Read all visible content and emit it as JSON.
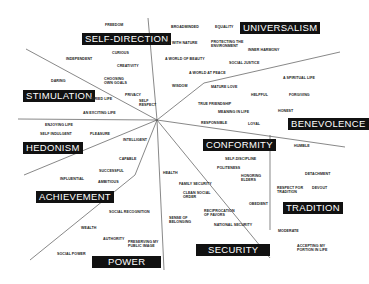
{
  "diagram": {
    "line_color": "#555555",
    "category_bg": "#111111",
    "category_fg": "#ffffff",
    "categories": [
      {
        "name": "self-direction",
        "label": "SELF-DIRECTION",
        "x": 82,
        "y": 33
      },
      {
        "name": "universalism",
        "label": "UNIVERSALISM",
        "x": 240,
        "y": 22
      },
      {
        "name": "stimulation",
        "label": "STIMULATION",
        "x": 23,
        "y": 90
      },
      {
        "name": "benevolence",
        "label": "BENEVOLENCE",
        "x": 288,
        "y": 118
      },
      {
        "name": "hedonism",
        "label": "HEDONISM",
        "x": 23,
        "y": 142
      },
      {
        "name": "conformity",
        "label": "CONFORMITY",
        "x": 203,
        "y": 139
      },
      {
        "name": "achievement",
        "label": "ACHIEVEMENT",
        "x": 36,
        "y": 191
      },
      {
        "name": "tradition",
        "label": "TRADITION",
        "x": 283,
        "y": 202
      },
      {
        "name": "security",
        "label": "SECURITY",
        "x": 196,
        "y": 244
      },
      {
        "name": "power",
        "label": "POWER",
        "x": 92,
        "y": 256
      }
    ],
    "values": [
      {
        "text": "FREEDOM",
        "x": 105,
        "y": 23
      },
      {
        "text": "CURIOUS",
        "x": 112,
        "y": 51
      },
      {
        "text": "INDEPENDENT",
        "x": 66,
        "y": 57
      },
      {
        "text": "CREATIVITY",
        "x": 117,
        "y": 64
      },
      {
        "text": "DARING",
        "x": 51,
        "y": 79
      },
      {
        "text": "CHOOSING\nOWN GOALS",
        "x": 104,
        "y": 77
      },
      {
        "text": "PRIVACY",
        "x": 125,
        "y": 93
      },
      {
        "text": "A VARIED LIFE",
        "x": 86,
        "y": 97
      },
      {
        "text": "SELF\nRESPECT",
        "x": 139,
        "y": 99
      },
      {
        "text": "AN EXCITING LIFE",
        "x": 83,
        "y": 111
      },
      {
        "text": "ENJOYING LIFE",
        "x": 45,
        "y": 123
      },
      {
        "text": "SELF INDULGENT",
        "x": 40,
        "y": 132
      },
      {
        "text": "PLEASURE",
        "x": 90,
        "y": 132
      },
      {
        "text": "INTELLIGENT",
        "x": 123,
        "y": 138
      },
      {
        "text": "CAPABLE",
        "x": 119,
        "y": 157
      },
      {
        "text": "SUCCESSFUL",
        "x": 99,
        "y": 169
      },
      {
        "text": "INFLUENTIAL",
        "x": 60,
        "y": 177
      },
      {
        "text": "AMBITIOUS",
        "x": 98,
        "y": 180
      },
      {
        "text": "SOCIAL RECOGNITION",
        "x": 109,
        "y": 210
      },
      {
        "text": "WEALTH",
        "x": 81,
        "y": 226
      },
      {
        "text": "AUTHORITY",
        "x": 103,
        "y": 237
      },
      {
        "text": "PRESERVING MY\nPUBLIC IMAGE",
        "x": 128,
        "y": 240
      },
      {
        "text": "SOCIAL POWER",
        "x": 57,
        "y": 252
      },
      {
        "text": "BROADMINDED",
        "x": 171,
        "y": 25
      },
      {
        "text": "EQUALITY",
        "x": 215,
        "y": 25
      },
      {
        "text": "UNITY WITH NATURE",
        "x": 160,
        "y": 41
      },
      {
        "text": "PROTECTING THE\nENVIRONMENT",
        "x": 211,
        "y": 40
      },
      {
        "text": "INNER HARMONY",
        "x": 248,
        "y": 48
      },
      {
        "text": "A WORLD OF BEAUTY",
        "x": 165,
        "y": 57
      },
      {
        "text": "SOCIAL JUSTICE",
        "x": 229,
        "y": 61
      },
      {
        "text": "A WORLD AT PEACE",
        "x": 189,
        "y": 71
      },
      {
        "text": "WISDOM",
        "x": 172,
        "y": 84
      },
      {
        "text": "A SPIRITUAL LIFE",
        "x": 283,
        "y": 76
      },
      {
        "text": "MATURE LOVE",
        "x": 211,
        "y": 85
      },
      {
        "text": "HELPFUL",
        "x": 251,
        "y": 93
      },
      {
        "text": "FORGIVING",
        "x": 289,
        "y": 93
      },
      {
        "text": "TRUE FRIENDSHIP",
        "x": 198,
        "y": 102
      },
      {
        "text": "HONEST",
        "x": 278,
        "y": 109
      },
      {
        "text": "MEANING IN LIFE",
        "x": 218,
        "y": 110
      },
      {
        "text": "RESPONSIBLE",
        "x": 201,
        "y": 121
      },
      {
        "text": "LOYAL",
        "x": 248,
        "y": 122
      },
      {
        "text": "HUMBLE",
        "x": 294,
        "y": 144
      },
      {
        "text": "SELF-DISCIPLINE",
        "x": 225,
        "y": 157
      },
      {
        "text": "POLITENESS",
        "x": 217,
        "y": 166
      },
      {
        "text": "HEALTH",
        "x": 163,
        "y": 171
      },
      {
        "text": "HONORING\nELDERS",
        "x": 241,
        "y": 174
      },
      {
        "text": "DETACHMENT",
        "x": 305,
        "y": 172
      },
      {
        "text": "FAMILY SECURITY",
        "x": 179,
        "y": 182
      },
      {
        "text": "RESPECT FOR\nTRADITION",
        "x": 277,
        "y": 186
      },
      {
        "text": "DEVOUT",
        "x": 312,
        "y": 186
      },
      {
        "text": "CLEAN SOCIAL\nORDER",
        "x": 183,
        "y": 191
      },
      {
        "text": "OBEDIENT",
        "x": 249,
        "y": 202
      },
      {
        "text": "RECIPROCATION\nOF FAVORS",
        "x": 204,
        "y": 209
      },
      {
        "text": "SENSE OF\nBELONGING",
        "x": 169,
        "y": 216
      },
      {
        "text": "NATIONAL SECURITY",
        "x": 214,
        "y": 223
      },
      {
        "text": "MODERATE",
        "x": 278,
        "y": 229
      },
      {
        "text": "ACCEPTING MY\nPORTION IN LIFE",
        "x": 297,
        "y": 244
      }
    ],
    "center": {
      "x": 157,
      "y": 120
    }
  }
}
